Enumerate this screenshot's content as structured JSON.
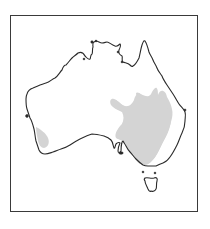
{
  "map": {
    "title": "Distribution map of Australia",
    "region": "Australia",
    "frame": {
      "border_color": "#3a3a3a",
      "background": "#ffffff"
    },
    "coastline_color": "#2a2a2a",
    "range_color": "#d4d4d4",
    "distribution_areas": [
      {
        "name": "eastern-range",
        "label": "Eastern inland and south-east range"
      },
      {
        "name": "south-western-range",
        "label": "South-west Western Australia range"
      }
    ],
    "landmasses": [
      {
        "name": "mainland",
        "label": "Australian mainland"
      },
      {
        "name": "tasmania",
        "label": "Tasmania"
      }
    ]
  }
}
